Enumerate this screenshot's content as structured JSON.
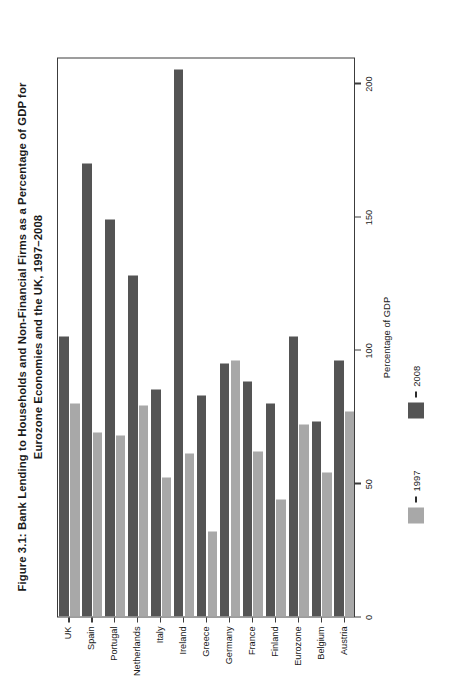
{
  "figure": {
    "title_lines": [
      "Figure 3.1: Bank Lending to Households and Non-Financial Firms as a Percentage of GDP for",
      "Eurozone Economies and the UK, 1997–2008"
    ],
    "title_full": "Figure 3.1: Bank Lending to Households and Non-Financial Firms as a Percentage of GDP for Eurozone Economies and the UK, 1997–2008"
  },
  "legend": {
    "position": "bottom",
    "items": [
      {
        "label": "1997",
        "color": "#a8a8a8",
        "dash": "–"
      },
      {
        "label": "2008",
        "color": "#545454",
        "dash": "–"
      }
    ]
  },
  "axis": {
    "value_title": "Percentage of GDP",
    "value_ticks": [
      "0",
      "50",
      "100",
      "150",
      "200"
    ],
    "category_title": ""
  },
  "chart_data": {
    "type": "bar",
    "orientation": "horizontal",
    "title": "Figure 3.1: Bank Lending to Households and Non-Financial Firms as a Percentage of GDP for Eurozone Economies and the UK, 1997–2008",
    "xlabel": "Percentage of GDP",
    "ylabel": "",
    "xlim": [
      0,
      210
    ],
    "xticks": [
      0,
      50,
      100,
      150,
      200
    ],
    "grid": false,
    "legend_position": "bottom",
    "categories": [
      "Austria",
      "Belgium",
      "Eurozone",
      "Finland",
      "France",
      "Germany",
      "Greece",
      "Ireland",
      "Italy",
      "Netherlands",
      "Portugal",
      "Spain",
      "UK"
    ],
    "series": [
      {
        "name": "1997",
        "color": "#a8a8a8",
        "values": [
          77,
          54,
          72,
          44,
          62,
          96,
          32,
          61,
          52,
          79,
          68,
          69,
          80
        ]
      },
      {
        "name": "2008",
        "color": "#545454",
        "values": [
          96,
          73,
          105,
          80,
          88,
          95,
          83,
          205,
          85,
          128,
          149,
          170,
          105
        ]
      }
    ]
  }
}
